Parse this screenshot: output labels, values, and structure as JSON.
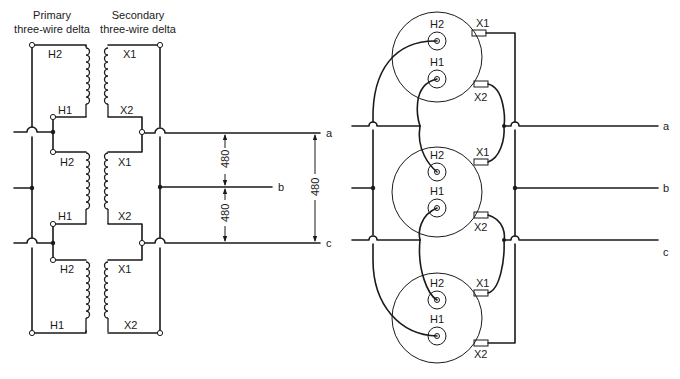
{
  "left_diagram": {
    "primary_header_line1": "Primary",
    "primary_header_line2": "three-wire delta",
    "secondary_header_line1": "Secondary",
    "secondary_header_line2": "three-wire delta",
    "primary_labels": [
      "H2",
      "H1",
      "H2",
      "H1",
      "H2",
      "H1"
    ],
    "secondary_labels": [
      "X1",
      "X2",
      "X1",
      "X2",
      "X1",
      "X2"
    ],
    "voltage_ab": "480",
    "voltage_bc": "480",
    "voltage_ac": "480",
    "line_a": "a",
    "line_b": "b",
    "line_c": "c"
  },
  "right_diagram": {
    "transformers": [
      {
        "h_top": "H2",
        "h_bottom": "H1",
        "x_top": "X1",
        "x_bottom": "X2"
      },
      {
        "h_top": "H2",
        "h_bottom": "H1",
        "x_top": "X1",
        "x_bottom": "X2"
      },
      {
        "h_top": "H2",
        "h_bottom": "H1",
        "x_top": "X1",
        "x_bottom": "X2"
      }
    ],
    "line_a": "a",
    "line_b": "b",
    "line_c": "c"
  }
}
